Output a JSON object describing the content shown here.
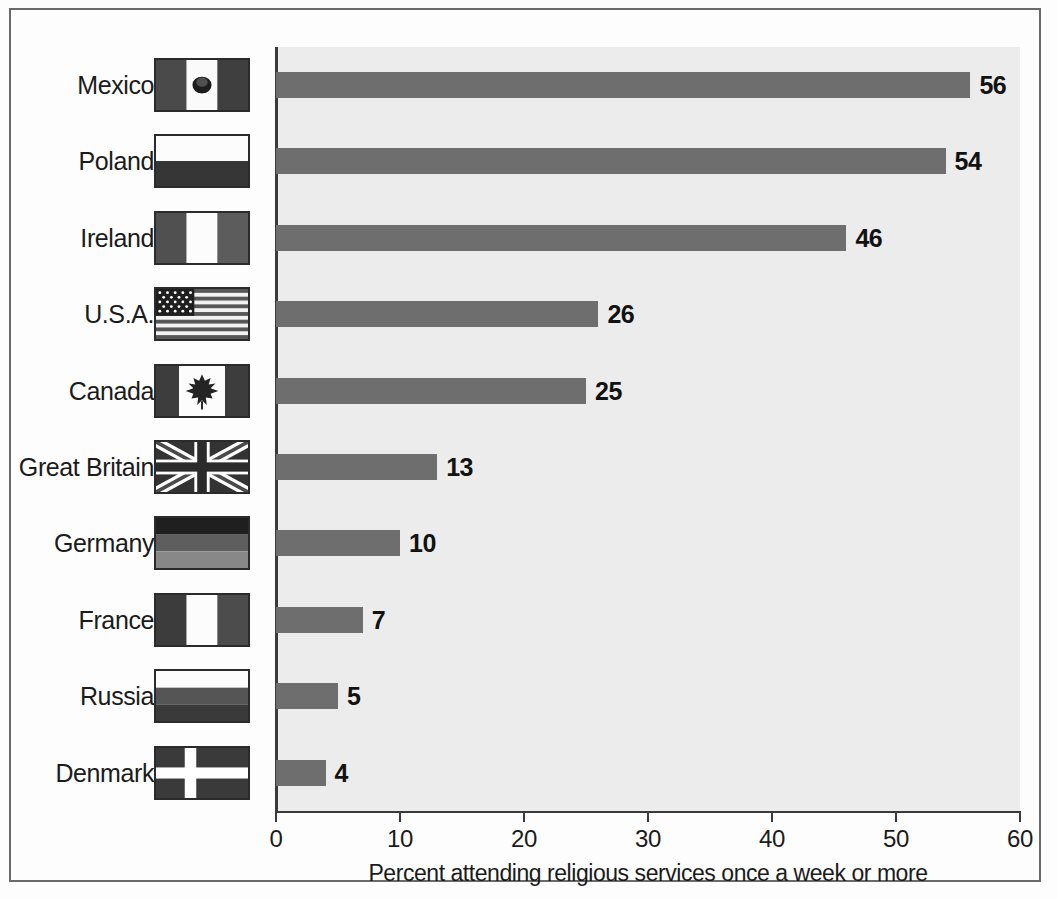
{
  "chart_data": {
    "type": "bar",
    "orientation": "horizontal",
    "title": "",
    "xlabel": "Percent attending religious services once a week or more",
    "ylabel": "",
    "categories": [
      "Mexico",
      "Poland",
      "Ireland",
      "U.S.A.",
      "Canada",
      "Great Britain",
      "Germany",
      "France",
      "Russia",
      "Denmark"
    ],
    "values": [
      56,
      54,
      46,
      26,
      25,
      13,
      10,
      7,
      5,
      4
    ],
    "xlim": [
      0,
      60
    ],
    "xticks": [
      0,
      10,
      20,
      30,
      40,
      50,
      60
    ],
    "xtick_labels": [
      "0",
      "10",
      "20",
      "30",
      "40",
      "50",
      "60"
    ],
    "grid": false,
    "legend": "none",
    "bar_color": "#6e6e6e",
    "panel_color": "#ececec",
    "axis_color": "#3a3a3a",
    "value_labels": [
      "56",
      "54",
      "46",
      "26",
      "25",
      "13",
      "10",
      "7",
      "5",
      "4"
    ]
  },
  "rows": [
    {
      "country": "Mexico",
      "value": 56,
      "value_label": "56",
      "flag": "flag-mexico"
    },
    {
      "country": "Poland",
      "value": 54,
      "value_label": "54",
      "flag": "flag-poland"
    },
    {
      "country": "Ireland",
      "value": 46,
      "value_label": "46",
      "flag": "flag-ireland"
    },
    {
      "country": "U.S.A.",
      "value": 26,
      "value_label": "26",
      "flag": "flag-usa"
    },
    {
      "country": "Canada",
      "value": 25,
      "value_label": "25",
      "flag": "flag-canada"
    },
    {
      "country": "Great Britain",
      "value": 13,
      "value_label": "13",
      "flag": "flag-great-britain"
    },
    {
      "country": "Germany",
      "value": 10,
      "value_label": "10",
      "flag": "flag-germany"
    },
    {
      "country": "France",
      "value": 7,
      "value_label": "7",
      "flag": "flag-france"
    },
    {
      "country": "Russia",
      "value": 5,
      "value_label": "5",
      "flag": "flag-russia"
    },
    {
      "country": "Denmark",
      "value": 4,
      "value_label": "4",
      "flag": "flag-denmark"
    }
  ],
  "axis": {
    "title": "Percent attending religious services once a week or more",
    "ticks": [
      "0",
      "10",
      "20",
      "30",
      "40",
      "50",
      "60"
    ]
  }
}
